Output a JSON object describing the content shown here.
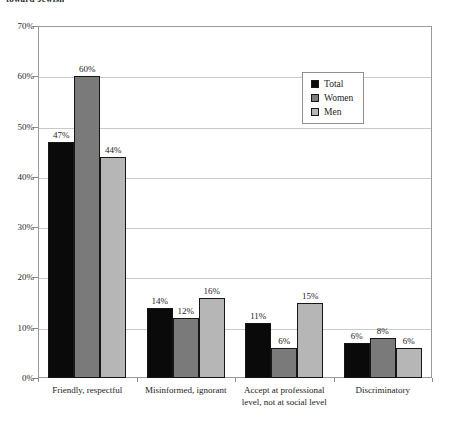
{
  "title_fragment": "toward Jewish",
  "chart_data": {
    "type": "bar",
    "title": "toward Jewish",
    "subtitle": "",
    "xlabel": "",
    "ylabel": "",
    "ylim": [
      0,
      70
    ],
    "ytick_labels": [
      "0%",
      "10%",
      "20%",
      "30%",
      "40%",
      "50%",
      "60%",
      "70%"
    ],
    "ytick_values": [
      0,
      10,
      20,
      30,
      40,
      50,
      60,
      70
    ],
    "grid": true,
    "legend_position": "upper right",
    "value_suffix": "%",
    "categories": [
      "Friendly, respectful",
      "Misinformed, ignorant",
      "Accept at professional level, not at social level",
      "Discriminatory"
    ],
    "category_lines": [
      [
        "Friendly, respectful"
      ],
      [
        "Misinformed, ignorant"
      ],
      [
        "Accept at professional",
        "level, not at social level"
      ],
      [
        "Discriminatory"
      ]
    ],
    "series": [
      {
        "name": "Total",
        "color": "#0a0a0a",
        "values": [
          47,
          14,
          11,
          7
        ],
        "labels": [
          "47%",
          "14%",
          "11%",
          "6%"
        ]
      },
      {
        "name": "Women",
        "color": "#7a7a7a",
        "values": [
          60,
          12,
          6,
          8
        ],
        "labels": [
          "60%",
          "12%",
          "6%",
          "8%"
        ]
      },
      {
        "name": "Men",
        "color": "#b6b6b6",
        "values": [
          44,
          16,
          15,
          6
        ],
        "labels": [
          "44%",
          "16%",
          "15%",
          "6%"
        ]
      }
    ]
  },
  "colors": {
    "total": "#0a0a0a",
    "women": "#7a7a7a",
    "men": "#b6b6b6",
    "frame": "#9a9a9a",
    "grid": "#c9c9c9"
  }
}
